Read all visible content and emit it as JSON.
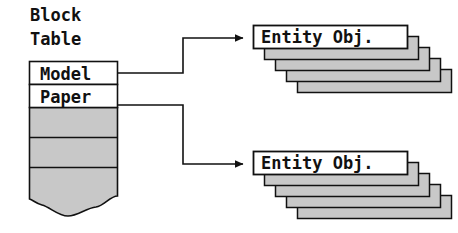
{
  "diagram": {
    "type": "block-table-to-entity-objects",
    "colors": {
      "stroke": "#111111",
      "fill_white": "#ffffff",
      "fill_gray": "#c8c8c8",
      "shadow_gray": "#c8c8c8",
      "background": "#ffffff"
    },
    "block_table": {
      "title_lines": [
        "Block",
        "Table"
      ],
      "title": "Block Table",
      "rows": [
        {
          "label": "Model",
          "filled": false,
          "linked": true
        },
        {
          "label": "Paper",
          "filled": false,
          "linked": true
        },
        {
          "label": "",
          "filled": true,
          "linked": false
        },
        {
          "label": "",
          "filled": true,
          "linked": false
        },
        {
          "label": "",
          "filled": true,
          "linked": false
        }
      ],
      "bottom_edge": "torn-wavy"
    },
    "entity_stacks": [
      {
        "label": "Entity Obj.",
        "source_row": "Model",
        "stack_depth": 5
      },
      {
        "label": "Entity Obj.",
        "source_row": "Paper",
        "stack_depth": 5
      }
    ],
    "connectors": [
      {
        "from": "Model",
        "to": "Entity Obj. (top)",
        "arrow": "filled-triangle"
      },
      {
        "from": "Paper",
        "to": "Entity Obj. (bottom)",
        "arrow": "filled-triangle"
      }
    ]
  }
}
